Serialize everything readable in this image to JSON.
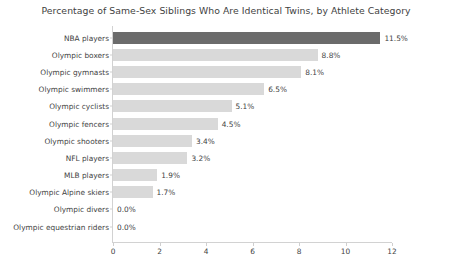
{
  "chart_data": {
    "type": "bar",
    "orientation": "horizontal",
    "title": "Percentage of Same-Sex Siblings Who Are Identical Twins, by Athlete Category",
    "xlabel": "",
    "ylabel": "",
    "xlim": [
      0,
      12
    ],
    "grid": false,
    "legend": null,
    "xticks": [
      "0",
      "2",
      "4",
      "6",
      "8",
      "10",
      "12"
    ],
    "xtick_values": [
      0,
      2,
      4,
      6,
      8,
      10,
      12
    ],
    "categories": [
      "NBA players",
      "Olympic boxers",
      "Olympic gymnasts",
      "Olympic swimmers",
      "Olympic cyclists",
      "Olympic fencers",
      "Olympic shooters",
      "NFL players",
      "MLB players",
      "Olympic Alpine skiers",
      "Olympic divers",
      "Olympic equestrian riders"
    ],
    "values": [
      11.5,
      8.8,
      8.1,
      6.5,
      5.1,
      4.5,
      3.4,
      3.2,
      1.9,
      1.7,
      0.0,
      0.0
    ],
    "data_labels": [
      "11.5%",
      "8.8%",
      "8.1%",
      "6.5%",
      "5.1%",
      "4.5%",
      "3.4%",
      "3.2%",
      "1.9%",
      "1.7%",
      "0.0%",
      "0.0%"
    ],
    "highlight_index": 0,
    "colors": {
      "bar": "#d9d9d9",
      "bar_highlight": "#6b6b6b",
      "text": "#3f3f3f",
      "axis": "#d2d2d2",
      "background": "#ffffff"
    }
  }
}
